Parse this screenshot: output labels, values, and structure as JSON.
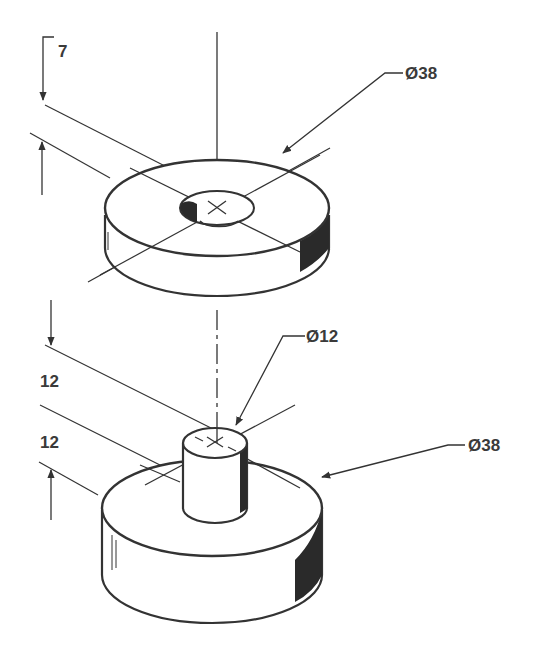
{
  "drawing": {
    "type": "isometric technical drawing",
    "ink_color": "#333333",
    "shade_color": "#2a2a2a",
    "parts": [
      {
        "name": "top washer",
        "dimensions": {
          "thickness_label": "7",
          "outer_diameter_label": "Ø38"
        }
      },
      {
        "name": "bottom cylinder with boss",
        "dimensions": {
          "boss_height_label": "12",
          "base_height_label": "12",
          "boss_diameter_label": "Ø12",
          "base_diameter_label": "Ø38"
        }
      }
    ]
  },
  "labels": {
    "top_thickness": "7",
    "top_diameter": "Ø38",
    "boss_diameter": "Ø12",
    "boss_height": "12",
    "base_height": "12",
    "base_diameter": "Ø38"
  }
}
